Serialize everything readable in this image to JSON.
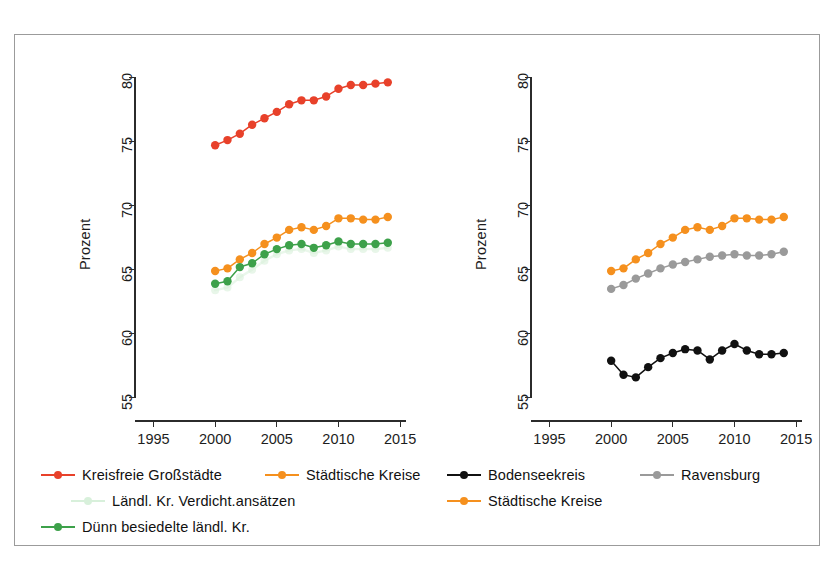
{
  "figure": {
    "partial_title": "",
    "frame_color": "#9b9b9b",
    "background": "#ffffff"
  },
  "colors": {
    "red": "#E8412A",
    "orange": "#F5901E",
    "green": "#3DA14A",
    "light_green": "#D8F0DB",
    "gray": "#9A9A9A",
    "black": "#111111",
    "axis": "#2b2b2b",
    "text": "#1d1d1d"
  },
  "left_panel": {
    "ylabel": "Prozent",
    "yticks": [
      "55",
      "60",
      "65",
      "70",
      "75",
      "80"
    ],
    "xticks": [
      "1995",
      "2000",
      "2005",
      "2010",
      "2015"
    ],
    "legend": [
      {
        "label": "Kreisfreie Großstädte",
        "color": "#E8412A"
      },
      {
        "label": "Städtische Kreise",
        "color": "#F5901E"
      },
      {
        "label": "Ländl. Kr. Verdicht.ansätzen",
        "color": "#D8F0DB"
      },
      {
        "label": "Dünn besiedelte ländl. Kr.",
        "color": "#3DA14A"
      }
    ]
  },
  "right_panel": {
    "ylabel": "Prozent",
    "yticks": [
      "55",
      "60",
      "65",
      "70",
      "75",
      "80"
    ],
    "xticks": [
      "1995",
      "2000",
      "2005",
      "2010",
      "2015"
    ],
    "legend": [
      {
        "label": "Bodenseekreis",
        "color": "#111111"
      },
      {
        "label": "Ravensburg",
        "color": "#9A9A9A"
      },
      {
        "label": "Städtische Kreise",
        "color": "#F5901E"
      }
    ]
  },
  "chart_data": [
    {
      "type": "line",
      "panel": "left",
      "title": "",
      "xlabel": "",
      "ylabel": "Prozent",
      "xlim": [
        1993.5,
        2015.8
      ],
      "ylim": [
        53.2,
        81.5
      ],
      "xticks": [
        1995,
        2000,
        2005,
        2010,
        2015
      ],
      "yticks": [
        55,
        60,
        65,
        70,
        75,
        80
      ],
      "grid": false,
      "legend_position": "below",
      "x": [
        2000,
        2001,
        2002,
        2003,
        2004,
        2005,
        2006,
        2007,
        2008,
        2009,
        2010,
        2011,
        2012,
        2013,
        2014
      ],
      "series": [
        {
          "name": "Kreisfreie Großstädte",
          "color": "#E8412A",
          "values": [
            74.7,
            75.1,
            75.6,
            76.3,
            76.8,
            77.3,
            77.9,
            78.2,
            78.2,
            78.5,
            79.1,
            79.4,
            79.4,
            79.5,
            79.6
          ]
        },
        {
          "name": "Städtische Kreise",
          "color": "#F5901E",
          "values": [
            64.9,
            65.1,
            65.8,
            66.3,
            67.0,
            67.5,
            68.1,
            68.3,
            68.1,
            68.4,
            69.0,
            69.0,
            68.9,
            68.9,
            69.1
          ]
        },
        {
          "name": "Ländl. Kr. Verdicht.ansätzen",
          "color": "#D8F0DB",
          "values": [
            63.4,
            63.6,
            64.4,
            65.0,
            65.7,
            66.2,
            66.5,
            66.6,
            66.3,
            66.5,
            66.8,
            66.6,
            66.6,
            66.6,
            66.7
          ]
        },
        {
          "name": "Dünn besiedelte ländl. Kr.",
          "color": "#3DA14A",
          "values": [
            63.9,
            64.1,
            65.2,
            65.5,
            66.2,
            66.6,
            66.9,
            67.0,
            66.7,
            66.9,
            67.2,
            67.0,
            67.0,
            67.0,
            67.1
          ]
        }
      ]
    },
    {
      "type": "line",
      "panel": "right",
      "title": "",
      "xlabel": "",
      "ylabel": "Prozent",
      "xlim": [
        1993.5,
        2015.8
      ],
      "ylim": [
        53.2,
        81.5
      ],
      "xticks": [
        1995,
        2000,
        2005,
        2010,
        2015
      ],
      "yticks": [
        55,
        60,
        65,
        70,
        75,
        80
      ],
      "grid": false,
      "legend_position": "below",
      "x": [
        2000,
        2001,
        2002,
        2003,
        2004,
        2005,
        2006,
        2007,
        2008,
        2009,
        2010,
        2011,
        2012,
        2013,
        2014
      ],
      "series": [
        {
          "name": "Bodenseekreis",
          "color": "#111111",
          "values": [
            57.9,
            56.8,
            56.6,
            57.4,
            58.1,
            58.5,
            58.8,
            58.7,
            58.0,
            58.7,
            59.2,
            58.7,
            58.4,
            58.4,
            58.5
          ]
        },
        {
          "name": "Ravensburg",
          "color": "#9A9A9A",
          "values": [
            63.5,
            63.8,
            64.3,
            64.7,
            65.1,
            65.4,
            65.6,
            65.8,
            66.0,
            66.1,
            66.2,
            66.1,
            66.1,
            66.2,
            66.4
          ]
        },
        {
          "name": "Städtische Kreise",
          "color": "#F5901E",
          "values": [
            64.9,
            65.1,
            65.8,
            66.3,
            67.0,
            67.5,
            68.1,
            68.3,
            68.1,
            68.4,
            69.0,
            69.0,
            68.9,
            68.9,
            69.1
          ]
        }
      ]
    }
  ]
}
